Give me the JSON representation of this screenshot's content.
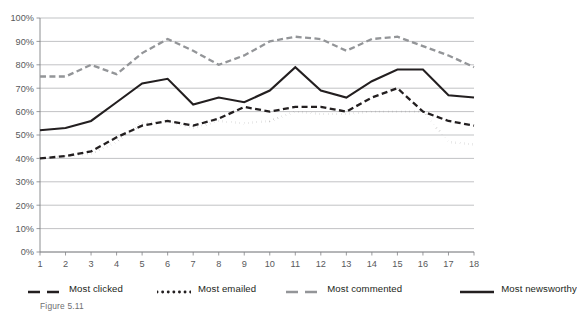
{
  "figure": {
    "caption": "Figure 5.11"
  },
  "chart_data": {
    "type": "line",
    "title": "",
    "xlabel": "",
    "ylabel": "",
    "x": [
      1,
      2,
      3,
      4,
      5,
      6,
      7,
      8,
      9,
      10,
      11,
      12,
      13,
      14,
      15,
      16,
      17,
      18
    ],
    "categories": [
      "1",
      "2",
      "3",
      "4",
      "5",
      "6",
      "7",
      "8",
      "9",
      "10",
      "11",
      "12",
      "13",
      "14",
      "15",
      "16",
      "17",
      "18"
    ],
    "xlim": [
      1,
      18
    ],
    "ylim": [
      0,
      100
    ],
    "ytick_labels": [
      "0%",
      "10%",
      "20%",
      "30%",
      "40%",
      "50%",
      "60%",
      "70%",
      "80%",
      "90%",
      "100%"
    ],
    "ytick_values": [
      0,
      10,
      20,
      30,
      40,
      50,
      60,
      70,
      80,
      90,
      100
    ],
    "grid": true,
    "grid_axis": "y",
    "legend_position": "bottom",
    "series": [
      {
        "name": "Most clicked",
        "style": "dashed",
        "color": "#231f20",
        "values": [
          40,
          41,
          43,
          49,
          54,
          56,
          54,
          57,
          62,
          60,
          62,
          62,
          60,
          66,
          70,
          60,
          56,
          54
        ]
      },
      {
        "name": "Most emailed",
        "style": "dotted",
        "color": "#231f20",
        "values": [
          40,
          41,
          42,
          47,
          55,
          56,
          53,
          56,
          55,
          56,
          60,
          59,
          59,
          60,
          60,
          60,
          47,
          46
        ]
      },
      {
        "name": "Most commented",
        "style": "dashed",
        "color": "#939598",
        "values": [
          75,
          75,
          80,
          76,
          85,
          91,
          86,
          80,
          84,
          90,
          92,
          91,
          86,
          91,
          92,
          88,
          84,
          79
        ]
      },
      {
        "name": "Most newsworthy",
        "style": "solid",
        "color": "#231f20",
        "values": [
          52,
          53,
          56,
          64,
          72,
          74,
          63,
          66,
          64,
          69,
          79,
          69,
          66,
          73,
          78,
          78,
          67,
          66
        ]
      }
    ]
  },
  "legend": {
    "items": [
      {
        "label": "Most clicked",
        "style": "dashed",
        "color": "#231f20"
      },
      {
        "label": "Most emailed",
        "style": "dotted",
        "color": "#231f20"
      },
      {
        "label": "Most commented",
        "style": "dashed",
        "color": "#939598"
      },
      {
        "label": "Most newsworthy",
        "style": "solid",
        "color": "#231f20"
      }
    ]
  }
}
